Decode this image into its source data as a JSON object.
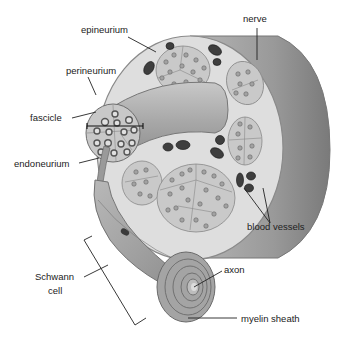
{
  "diagram": {
    "style": "grayscale anatomical illustration",
    "colors": {
      "background": "#ffffff",
      "nerve_outer": "#9a9a9a",
      "nerve_dark": "#7d7d7d",
      "epineurium": "#dcdcdc",
      "fascicle_fill": "#c4c4c4",
      "axon_ring": "#6a6a6a",
      "blood_vessel": "#3a3a3a",
      "label_text": "#222222"
    },
    "labels": {
      "epineurium": "epineurium",
      "nerve": "nerve",
      "perineurium": "perineurium",
      "fascicle": "fascicle",
      "endoneurium": "endoneurium",
      "blood_vessels": "blood vessels",
      "schwann_cell_line1": "Schwann",
      "schwann_cell_line2": "cell",
      "axon": "axon",
      "myelin_sheath": "myelin sheath"
    }
  }
}
